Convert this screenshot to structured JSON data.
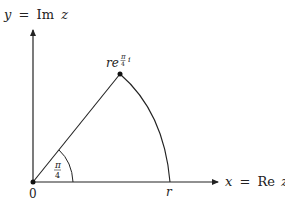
{
  "diagram": {
    "type": "complex-plane sector",
    "y_axis": {
      "var": "y",
      "eq": "=",
      "fn": "Im",
      "arg": "z"
    },
    "x_axis": {
      "var": "x",
      "eq": "=",
      "fn": "Re",
      "arg": "z"
    },
    "origin_label": "0",
    "radius_label": "r",
    "point_label": {
      "base": "re",
      "exp_num": "π",
      "exp_den": "4",
      "exp_suffix": "i"
    },
    "angle_label": {
      "num": "π",
      "den": "4"
    },
    "colors": {
      "stroke": "#222222",
      "background": "#ffffff"
    }
  }
}
